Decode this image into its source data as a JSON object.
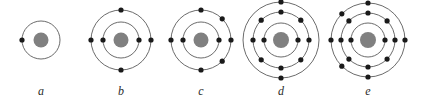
{
  "figure": {
    "background_color": "#ffffff",
    "orbit_stroke_color": "#5a5a5a",
    "orbit_stroke_width": 0.9,
    "nucleus_color": "#808080",
    "electron_color": "#1a1a1a",
    "label_color": "#2b2b2b",
    "width": 424,
    "height": 100
  },
  "diagram_type": "bohr-atomic-shell-models",
  "atoms": [
    {
      "id": "a",
      "label": "a",
      "center_x": 41,
      "center_y": 40,
      "nucleus_radius": 7.5,
      "total_electrons": 1,
      "shell_count": 1,
      "shells": [
        {
          "radius": 19,
          "electron_count": 1,
          "electron_angles_deg": [
            180
          ]
        }
      ]
    },
    {
      "id": "b",
      "label": "b",
      "center_x": 121,
      "center_y": 40,
      "nucleus_radius": 7.5,
      "total_electrons": 6,
      "shell_count": 2,
      "shells": [
        {
          "radius": 18,
          "electron_count": 2,
          "electron_angles_deg": [
            0,
            180
          ]
        },
        {
          "radius": 30,
          "electron_count": 4,
          "electron_angles_deg": [
            0,
            90,
            180,
            270
          ]
        }
      ]
    },
    {
      "id": "c",
      "label": "c",
      "center_x": 201,
      "center_y": 40,
      "nucleus_radius": 7.5,
      "total_electrons": 8,
      "shell_count": 2,
      "shells": [
        {
          "radius": 18,
          "electron_count": 2,
          "electron_angles_deg": [
            0,
            180
          ]
        },
        {
          "radius": 30,
          "electron_count": 6,
          "electron_angles_deg": [
            0,
            45,
            90,
            180,
            270,
            315
          ]
        }
      ]
    },
    {
      "id": "d",
      "label": "d",
      "center_x": 281,
      "center_y": 40,
      "nucleus_radius": 8,
      "total_electrons": 12,
      "shell_count": 3,
      "shells": [
        {
          "radius": 17,
          "electron_count": 2,
          "electron_angles_deg": [
            0,
            180
          ]
        },
        {
          "radius": 28,
          "electron_count": 8,
          "electron_angles_deg": [
            0,
            45,
            90,
            135,
            180,
            225,
            270,
            315
          ]
        },
        {
          "radius": 38,
          "electron_count": 2,
          "electron_angles_deg": [
            90,
            270
          ]
        }
      ]
    },
    {
      "id": "e",
      "label": "e",
      "center_x": 368,
      "center_y": 40,
      "nucleus_radius": 8,
      "total_electrons": 16,
      "shell_count": 3,
      "shells": [
        {
          "radius": 17,
          "electron_count": 2,
          "electron_angles_deg": [
            0,
            180
          ]
        },
        {
          "radius": 27,
          "electron_count": 8,
          "electron_angles_deg": [
            0,
            45,
            90,
            135,
            180,
            225,
            270,
            315
          ]
        },
        {
          "radius": 37,
          "electron_count": 6,
          "electron_angles_deg": [
            0,
            90,
            135,
            180,
            225,
            270
          ]
        }
      ]
    }
  ]
}
